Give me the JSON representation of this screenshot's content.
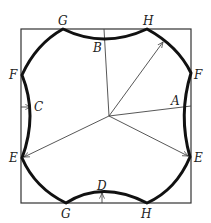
{
  "diagram": {
    "type": "geometric-construction",
    "labels": {
      "G_top": "G",
      "H_top": "H",
      "B": "B",
      "F_left": "F",
      "F_right": "F",
      "C": "C",
      "A": "A",
      "E_left": "E",
      "E_right": "E",
      "D": "D",
      "G_bottom": "G",
      "H_bottom": "H"
    },
    "colors": {
      "outline": "#111111",
      "frame": "#333333",
      "construction": "#444444"
    }
  }
}
